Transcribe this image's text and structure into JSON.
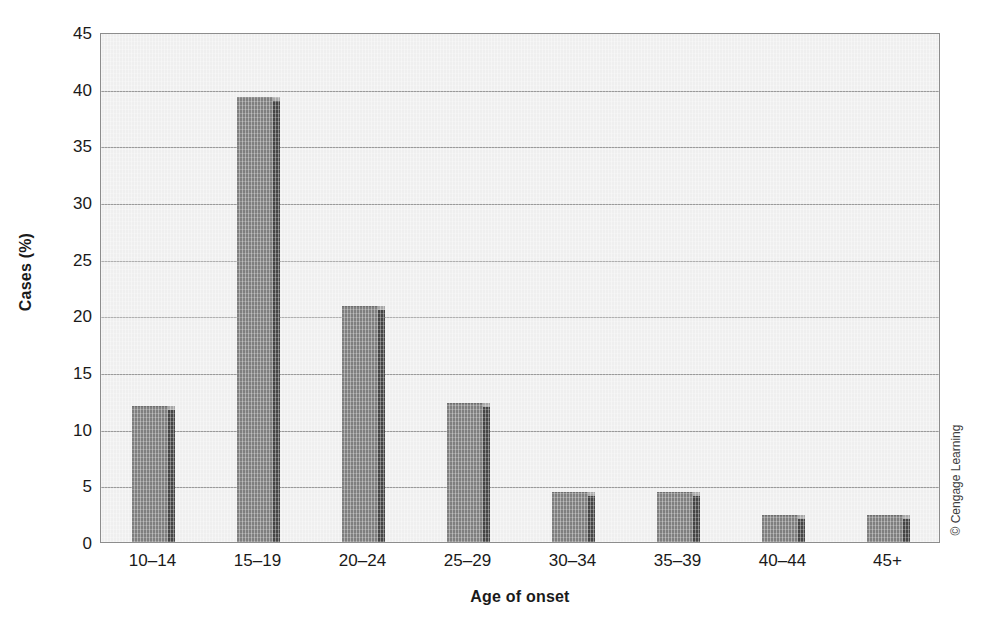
{
  "chart_data": {
    "type": "bar",
    "title": "",
    "subtitle": "",
    "xlabel": "Age of onset",
    "ylabel": "Cases (%)",
    "categories": [
      "10–14",
      "15–19",
      "20–24",
      "25–29",
      "30–34",
      "35–39",
      "40–44",
      "45+"
    ],
    "values": [
      12.0,
      39.3,
      20.8,
      12.3,
      4.4,
      4.4,
      2.4,
      2.4
    ],
    "series": [
      {
        "name": "Cases (%)",
        "values": [
          12.0,
          39.3,
          20.8,
          12.3,
          4.4,
          4.4,
          2.4,
          2.4
        ]
      }
    ],
    "ylim": [
      0,
      45
    ],
    "ytick_values": [
      0,
      5,
      10,
      15,
      20,
      25,
      30,
      35,
      40,
      45
    ],
    "ytick_labels": [
      "0",
      "5",
      "10",
      "15",
      "20",
      "25",
      "30",
      "35",
      "40",
      "45"
    ],
    "grid": "horizontal",
    "legend": "none",
    "bar_face_color": "#7f7f7f",
    "bar_side_color": "#454545",
    "plot_background_color": "#efefef",
    "gridline_color": "#9a9a9a",
    "axis_border_color": "#8d8d8d"
  },
  "credit": {
    "text": "© Cengage Learning"
  }
}
